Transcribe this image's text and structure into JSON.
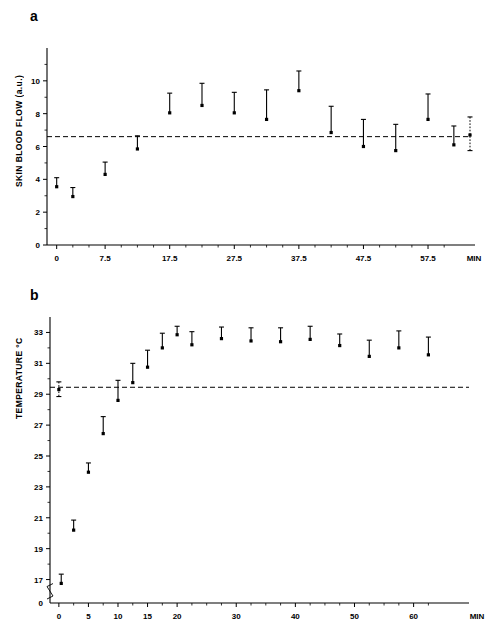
{
  "figure": {
    "panel_a_label": "a",
    "panel_b_label": "b"
  },
  "chart_data": [
    {
      "id": "panel-a",
      "type": "scatter",
      "title": "a",
      "xlabel": "MIN",
      "ylabel": "SKIN BLOOD FLOW (a.u.)",
      "xlim": [
        -1.5,
        64
      ],
      "ylim": [
        0,
        12
      ],
      "grid": false,
      "legend": "none",
      "x_ticks": [
        0,
        7.5,
        17.5,
        27.5,
        37.5,
        47.5,
        57.5
      ],
      "x_tick_labels": [
        "0",
        "7.5",
        "17.5",
        "27.5",
        "37.5",
        "47.5",
        "57.5"
      ],
      "x_minor_ticks": [
        2.5,
        5,
        10,
        12.5,
        15,
        20,
        22.5,
        25,
        30,
        32.5,
        35,
        40,
        42.5,
        45,
        50,
        52.5,
        55,
        60
      ],
      "y_ticks": [
        0,
        2,
        4,
        6,
        8,
        10
      ],
      "y_tick_labels": [
        "0",
        "2",
        "4",
        "6",
        "8",
        "10"
      ],
      "y_minor_ticks": [
        1,
        3,
        5,
        7,
        9,
        11
      ],
      "x_axis_end_label": "MIN",
      "baseline_value": 6.6,
      "baseline_style": "dashed",
      "points": [
        {
          "x": 0,
          "y": 3.55,
          "err_up": 0.55,
          "err_down": 0,
          "style": "solid"
        },
        {
          "x": 2.5,
          "y": 2.95,
          "err_up": 0.55,
          "err_down": 0,
          "style": "solid"
        },
        {
          "x": 7.5,
          "y": 4.3,
          "err_up": 0.75,
          "err_down": 0,
          "style": "solid"
        },
        {
          "x": 12.5,
          "y": 5.85,
          "err_up": 0.8,
          "err_down": 0,
          "style": "solid"
        },
        {
          "x": 17.5,
          "y": 8.05,
          "err_up": 1.2,
          "err_down": 0,
          "style": "solid"
        },
        {
          "x": 22.5,
          "y": 8.5,
          "err_up": 1.35,
          "err_down": 0,
          "style": "solid"
        },
        {
          "x": 27.5,
          "y": 8.05,
          "err_up": 1.25,
          "err_down": 0,
          "style": "solid"
        },
        {
          "x": 32.5,
          "y": 7.65,
          "err_up": 1.8,
          "err_down": 0,
          "style": "solid"
        },
        {
          "x": 37.5,
          "y": 9.4,
          "err_up": 1.2,
          "err_down": 0,
          "style": "solid"
        },
        {
          "x": 42.5,
          "y": 6.85,
          "err_up": 1.6,
          "err_down": 0,
          "style": "solid"
        },
        {
          "x": 47.5,
          "y": 6.0,
          "err_up": 1.65,
          "err_down": 0,
          "style": "solid"
        },
        {
          "x": 52.5,
          "y": 5.75,
          "err_up": 1.6,
          "err_down": 0,
          "style": "solid"
        },
        {
          "x": 57.5,
          "y": 7.65,
          "err_up": 1.55,
          "err_down": 0,
          "style": "solid"
        },
        {
          "x": 61.5,
          "y": 6.1,
          "err_up": 1.15,
          "err_down": 0,
          "style": "solid"
        },
        {
          "x": 64,
          "y": 6.7,
          "err_up": 1.1,
          "err_down": 0.95,
          "style": "dotted"
        }
      ]
    },
    {
      "id": "panel-b",
      "type": "scatter",
      "title": "b",
      "xlabel": "MIN",
      "ylabel": "TEMPERATURE °C",
      "xlim": [
        -1.5,
        67
      ],
      "ylim": [
        16,
        34
      ],
      "grid": false,
      "legend": "none",
      "axis_break": true,
      "axis_break_between": [
        0,
        17
      ],
      "x_ticks": [
        0,
        5,
        10,
        15,
        20,
        30,
        40,
        50,
        60
      ],
      "x_tick_labels": [
        "0",
        "5",
        "10",
        "15",
        "20",
        "30",
        "40",
        "50",
        "60"
      ],
      "x_minor_ticks": [
        2.5,
        7.5,
        12.5,
        17.5,
        22.5,
        25,
        27.5,
        32.5,
        35,
        37.5,
        42.5,
        45,
        47.5,
        52.5,
        55,
        57.5,
        62.5
      ],
      "y_ticks": [
        17,
        19,
        21,
        23,
        25,
        27,
        29,
        31,
        33
      ],
      "y_tick_labels": [
        "17",
        "19",
        "21",
        "23",
        "25",
        "27",
        "29",
        "31",
        "33"
      ],
      "y_zero_label": "0",
      "y_minor_ticks": [
        18,
        20,
        22,
        24,
        26,
        28,
        30,
        32
      ],
      "x_axis_end_label": "MIN",
      "baseline_value": 29.45,
      "baseline_style": "dashed",
      "points": [
        {
          "x": 0,
          "y": 29.3,
          "err_up": 0.5,
          "err_down": 0.45,
          "style": "dotted"
        },
        {
          "x": 0.4,
          "y": 16.75,
          "err_up": 0.6,
          "err_down": 0,
          "style": "solid"
        },
        {
          "x": 2.5,
          "y": 20.2,
          "err_up": 0.65,
          "err_down": 0,
          "style": "solid"
        },
        {
          "x": 5,
          "y": 23.95,
          "err_up": 0.6,
          "err_down": 0,
          "style": "solid"
        },
        {
          "x": 7.5,
          "y": 26.45,
          "err_up": 1.1,
          "err_down": 0,
          "style": "solid"
        },
        {
          "x": 10,
          "y": 28.6,
          "err_up": 1.3,
          "err_down": 0,
          "style": "solid"
        },
        {
          "x": 12.5,
          "y": 29.75,
          "err_up": 1.25,
          "err_down": 0,
          "style": "solid"
        },
        {
          "x": 15,
          "y": 30.75,
          "err_up": 1.1,
          "err_down": 0,
          "style": "solid"
        },
        {
          "x": 17.5,
          "y": 32.0,
          "err_up": 0.95,
          "err_down": 0,
          "style": "solid"
        },
        {
          "x": 20,
          "y": 32.85,
          "err_up": 0.55,
          "err_down": 0,
          "style": "solid"
        },
        {
          "x": 22.5,
          "y": 32.2,
          "err_up": 0.85,
          "err_down": 0,
          "style": "solid"
        },
        {
          "x": 27.5,
          "y": 32.6,
          "err_up": 0.75,
          "err_down": 0,
          "style": "solid"
        },
        {
          "x": 32.5,
          "y": 32.45,
          "err_up": 0.85,
          "err_down": 0,
          "style": "solid"
        },
        {
          "x": 37.5,
          "y": 32.4,
          "err_up": 0.9,
          "err_down": 0,
          "style": "solid"
        },
        {
          "x": 42.5,
          "y": 32.55,
          "err_up": 0.85,
          "err_down": 0,
          "style": "solid"
        },
        {
          "x": 47.5,
          "y": 32.15,
          "err_up": 0.75,
          "err_down": 0,
          "style": "solid"
        },
        {
          "x": 52.5,
          "y": 31.45,
          "err_up": 1.05,
          "err_down": 0,
          "style": "solid"
        },
        {
          "x": 57.5,
          "y": 32.0,
          "err_up": 1.1,
          "err_down": 0,
          "style": "solid"
        },
        {
          "x": 62.5,
          "y": 31.55,
          "err_up": 1.15,
          "err_down": 0,
          "style": "solid"
        }
      ]
    }
  ]
}
